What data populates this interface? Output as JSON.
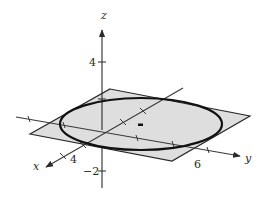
{
  "figure": {
    "axes": {
      "x": {
        "label": "x",
        "tick_label": "4"
      },
      "y": {
        "label": "y",
        "tick_label": "6"
      },
      "z": {
        "label": "z",
        "tick_labels": [
          "4",
          "−2"
        ]
      }
    },
    "colors": {
      "plane_fill": "#dedede",
      "line": "#2a2a2a",
      "circle_stroke": "#111111",
      "background": "#ffffff"
    }
  }
}
